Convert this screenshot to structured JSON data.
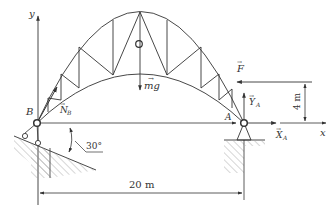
{
  "diagram": {
    "labels": {
      "y_axis": "y",
      "x_axis": "x",
      "point_b": "B",
      "point_a": "A",
      "normal_b": "N",
      "normal_b_sub": "B",
      "weight": "mg",
      "force_f": "F",
      "reaction_ya": "Y",
      "reaction_ya_sub": "A",
      "reaction_xa": "X",
      "reaction_xa_sub": "A",
      "angle": "30°",
      "height_dim": "4 m",
      "span_dim": "20 m"
    },
    "colors": {
      "line": "#333333",
      "hatch": "#777777"
    }
  }
}
